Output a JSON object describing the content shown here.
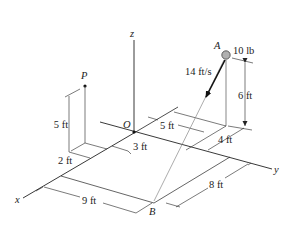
{
  "axes": {
    "x_label": "x",
    "y_label": "y",
    "z_label": "z",
    "origin_label": "O"
  },
  "points": {
    "A_label": "A",
    "B_label": "B",
    "P_label": "P"
  },
  "annotations": {
    "weight": "10 lb",
    "speed": "14 ft/s",
    "height_A": "6 ft",
    "height_P": "5 ft",
    "dim_2ft": "2 ft",
    "dim_3ft": "3 ft",
    "dim_5ft": "5 ft",
    "dim_4ft": "4 ft",
    "dim_9ft": "9 ft",
    "dim_8ft": "8 ft"
  },
  "colors": {
    "line": "#222222",
    "light_line": "#888888",
    "ball_fill": "#b0b0b0"
  }
}
